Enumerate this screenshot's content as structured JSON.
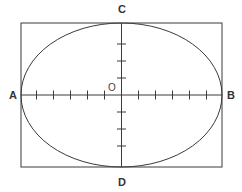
{
  "figure": {
    "background_color": "#ffffff",
    "stroke_color": "#3a3a3a",
    "label_color": "#333333",
    "canvas": {
      "width": 242,
      "height": 192
    }
  },
  "geometry": {
    "rectangle": {
      "x": 21,
      "y": 23,
      "width": 201,
      "height": 144,
      "stroke_width": 1
    },
    "ellipse": {
      "center_x": 121.5,
      "center_y": 95,
      "radius_x": 100.5,
      "radius_y": 72,
      "stroke_width": 1
    },
    "origin": {
      "x": 121.5,
      "y": 95
    },
    "x_axis": {
      "x1": 21,
      "y1": 95,
      "x2": 222,
      "y2": 95
    },
    "y_axis": {
      "x1": 121.5,
      "y1": 23,
      "x2": 121.5,
      "y2": 167
    },
    "tick_length": 9,
    "tick_spacing": 17,
    "x_ticks_left": 5,
    "x_ticks_right": 5,
    "y_ticks_up": 3,
    "y_ticks_down": 3
  },
  "labels": {
    "point_a": {
      "text": "A",
      "x": 13,
      "y": 99,
      "anchor": "middle"
    },
    "point_b": {
      "text": "B",
      "x": 231,
      "y": 99,
      "anchor": "middle"
    },
    "point_c": {
      "text": "C",
      "x": 122,
      "y": 13,
      "anchor": "middle"
    },
    "point_d": {
      "text": "D",
      "x": 122,
      "y": 186,
      "anchor": "middle"
    },
    "origin": {
      "text": "O",
      "x": 112,
      "y": 91,
      "anchor": "middle"
    }
  }
}
